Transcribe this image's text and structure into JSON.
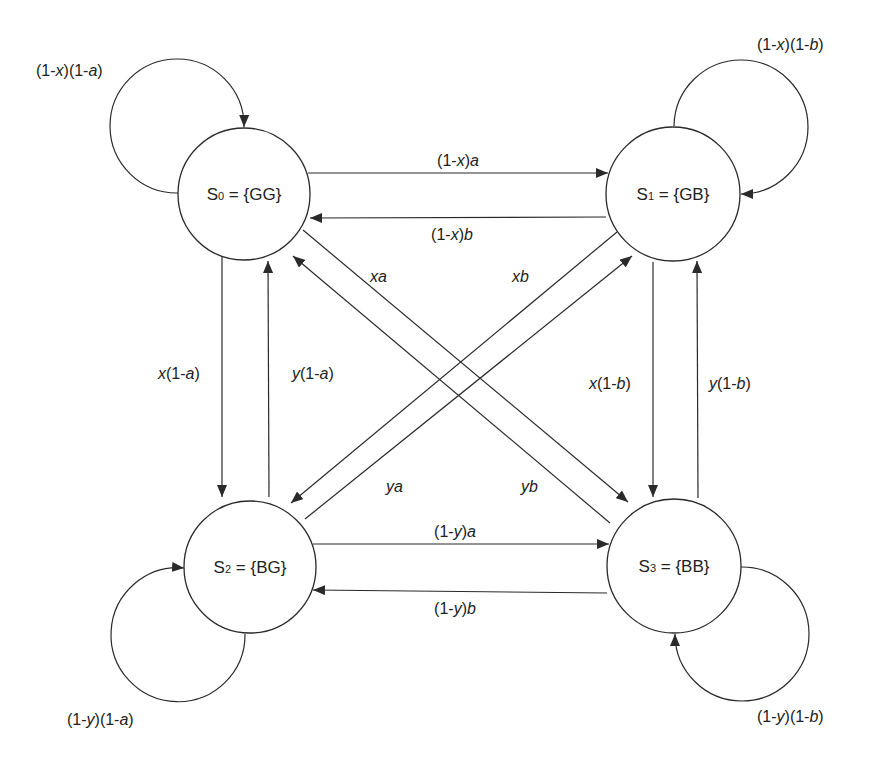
{
  "diagram": {
    "type": "state-transition (Markov chain)",
    "nodes": [
      {
        "id": "S0",
        "prefix": "S",
        "sub": "0",
        "set": " = {GG}"
      },
      {
        "id": "S1",
        "prefix": "S",
        "sub": "1",
        "set": " = {GB}"
      },
      {
        "id": "S2",
        "prefix": "S",
        "sub": "2",
        "set": " = {BG}"
      },
      {
        "id": "S3",
        "prefix": "S",
        "sub": "3",
        "set": " = {BB}"
      }
    ],
    "edges": [
      {
        "from": "S0",
        "to": "S0",
        "label": "(1-x)(1-a)",
        "parts": [
          "(1-",
          "x",
          ")(1-",
          "a",
          ")"
        ]
      },
      {
        "from": "S1",
        "to": "S1",
        "label": "(1-x)(1-b)",
        "parts": [
          "(1-",
          "x",
          ")(1-",
          "b",
          ")"
        ]
      },
      {
        "from": "S2",
        "to": "S2",
        "label": "(1-y)(1-a)",
        "parts": [
          "(1-",
          "y",
          ")(1-",
          "a",
          ")"
        ]
      },
      {
        "from": "S3",
        "to": "S3",
        "label": "(1-y)(1-b)",
        "parts": [
          "(1-",
          "y",
          ")(1-",
          "b",
          ")"
        ]
      },
      {
        "from": "S0",
        "to": "S1",
        "label": "(1-x)a",
        "parts": [
          "(1-",
          "x",
          ")",
          "a"
        ]
      },
      {
        "from": "S1",
        "to": "S0",
        "label": "(1-x)b",
        "parts": [
          "(1-",
          "x",
          ")",
          "b"
        ]
      },
      {
        "from": "S2",
        "to": "S3",
        "label": "(1-y)a",
        "parts": [
          "(1-",
          "y",
          ")",
          "a"
        ]
      },
      {
        "from": "S3",
        "to": "S2",
        "label": "(1-y)b",
        "parts": [
          "(1-",
          "y",
          ")",
          "b"
        ]
      },
      {
        "from": "S0",
        "to": "S2",
        "label": "x(1-a)",
        "parts": [
          "x",
          "(1-",
          "a",
          ")"
        ]
      },
      {
        "from": "S2",
        "to": "S0",
        "label": "y(1-a)",
        "parts": [
          "y",
          "(1-",
          "a",
          ")"
        ]
      },
      {
        "from": "S1",
        "to": "S3",
        "label": "x(1-b)",
        "parts": [
          "x",
          "(1-",
          "b",
          ")"
        ]
      },
      {
        "from": "S3",
        "to": "S1",
        "label": "y(1-b)",
        "parts": [
          "y",
          "(1-",
          "b",
          ")"
        ]
      },
      {
        "from": "S0",
        "to": "S3",
        "label": "xa",
        "parts": [
          "xa"
        ]
      },
      {
        "from": "S1",
        "to": "S2",
        "label": "xb",
        "parts": [
          "xb"
        ]
      },
      {
        "from": "S2",
        "to": "S1",
        "label": "ya",
        "parts": [
          "ya"
        ]
      },
      {
        "from": "S3",
        "to": "S0",
        "label": "yb",
        "parts": [
          "yb"
        ]
      }
    ],
    "colors": {
      "stroke": "#2a2a2a",
      "text": "#222222",
      "background": "#ffffff"
    }
  }
}
